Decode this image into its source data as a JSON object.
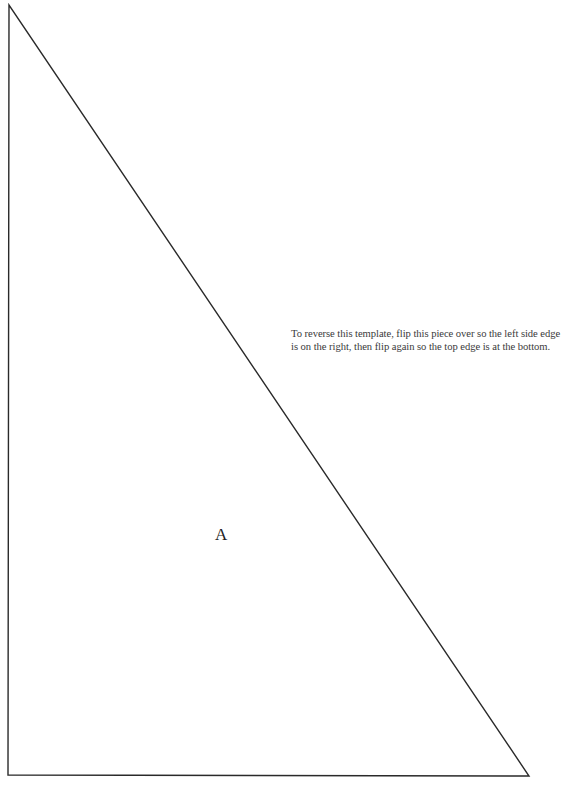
{
  "page": {
    "background": "#ffffff",
    "stroke_color": "#222222"
  },
  "template": {
    "shape": "right-triangle",
    "vertices": {
      "top": [
        9,
        5
      ],
      "bottom_left": [
        8,
        775
      ],
      "bottom_right": [
        529,
        776
      ]
    },
    "piece_label": "A"
  },
  "instructions": {
    "line1": "To reverse this template, flip this piece over so the left side edge",
    "line2": "is on the right, then flip again so the top edge is at the bottom."
  }
}
